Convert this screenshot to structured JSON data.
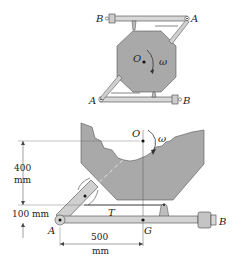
{
  "top_figure": {
    "labels": {
      "B_top": "B",
      "A_top": "A",
      "O": "O",
      "omega": "ω",
      "A_bottom": "A",
      "B_bottom": "B"
    }
  },
  "bottom_figure": {
    "labels": {
      "O": "O",
      "omega": "ω",
      "T": "T",
      "A": "A",
      "G": "G",
      "B": "B"
    },
    "dimensions": {
      "vertical_upper_value": "400",
      "vertical_upper_unit": "mm",
      "vertical_lower": "100 mm",
      "horizontal_value": "500",
      "horizontal_unit": "mm"
    }
  },
  "colors": {
    "body_fill": "#a9a9a9",
    "arm_fill": "#d3d3d3",
    "stroke": "#333333"
  }
}
